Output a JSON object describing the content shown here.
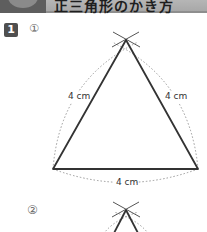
{
  "header": {
    "title": "正三角形のかき方"
  },
  "problem": {
    "number": "1",
    "parts": [
      {
        "label": "①",
        "side_labels": {
          "left": "4 cm",
          "right": "4 cm",
          "bottom": "4 cm"
        }
      },
      {
        "label": "②"
      }
    ]
  },
  "colors": {
    "header_badge": "#5e5e5e",
    "header_bar": "#b3b3b3",
    "line": "#333333",
    "arc": "#999999"
  }
}
